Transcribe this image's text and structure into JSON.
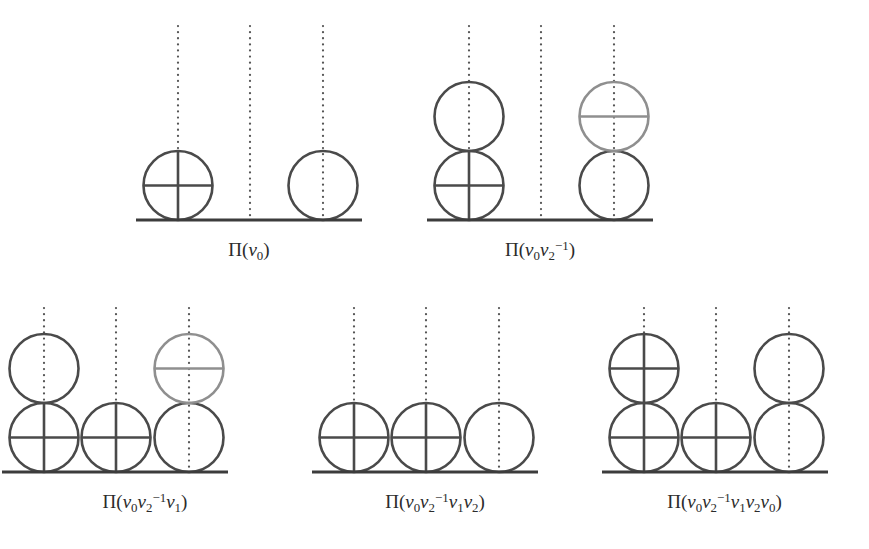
{
  "figure": {
    "background_color": "#ffffff",
    "stroke_color_dark": "#4a4a4a",
    "stroke_color_light": "#8f8f8f",
    "baseline_color": "#3c3c3c",
    "dot_color": "#555555",
    "label_color": "#2b2b2b",
    "circle_radius": 34.5,
    "column_spacing": 72,
    "stroke_width": 2.6,
    "baseline_width": 3.2
  },
  "panels": [
    {
      "id": "panel-1",
      "label_text": "Π(v₀)",
      "label_parts": {
        "pi": "Π",
        "open": "(",
        "terms": [
          {
            "base": "v",
            "sub": "0",
            "sup": ""
          }
        ],
        "close": ")"
      },
      "x": 104,
      "y": 8,
      "width": 290,
      "height": 250,
      "baseline": {
        "x1": 32,
        "x2": 258,
        "y": 212
      },
      "columns": [
        {
          "name": "column-1",
          "cx": 74,
          "dotted_top": 18,
          "circles": [
            {
              "level": 0,
              "marks": "cross",
              "tone": "dark"
            }
          ]
        },
        {
          "name": "column-2",
          "cx": 146,
          "dotted_top": 18,
          "circles": []
        },
        {
          "name": "column-3",
          "cx": 219,
          "dotted_top": 18,
          "circles": [
            {
              "level": 0,
              "marks": "none",
              "tone": "dark"
            }
          ]
        }
      ]
    },
    {
      "id": "panel-2",
      "label_text": "Π(v₀v₂⁻¹)",
      "label_parts": {
        "pi": "Π",
        "open": "(",
        "terms": [
          {
            "base": "v",
            "sub": "0",
            "sup": ""
          },
          {
            "base": "v",
            "sub": "2",
            "sup": "−1"
          }
        ],
        "close": ")"
      },
      "x": 395,
      "y": 8,
      "width": 290,
      "height": 250,
      "baseline": {
        "x1": 32,
        "x2": 258,
        "y": 212
      },
      "columns": [
        {
          "name": "column-1",
          "cx": 74,
          "dotted_top": 18,
          "circles": [
            {
              "level": 0,
              "marks": "cross",
              "tone": "dark"
            },
            {
              "level": 1,
              "marks": "none",
              "tone": "dark"
            }
          ]
        },
        {
          "name": "column-2",
          "cx": 146,
          "dotted_top": 18,
          "circles": []
        },
        {
          "name": "column-3",
          "cx": 219,
          "dotted_top": 18,
          "circles": [
            {
              "level": 0,
              "marks": "none",
              "tone": "dark"
            },
            {
              "level": 1,
              "marks": "horizontal",
              "tone": "light"
            }
          ]
        }
      ]
    },
    {
      "id": "panel-3",
      "label_text": "Π(v₀v₂⁻¹v₁)",
      "label_parts": {
        "pi": "Π",
        "open": "(",
        "terms": [
          {
            "base": "v",
            "sub": "0",
            "sup": ""
          },
          {
            "base": "v",
            "sub": "2",
            "sup": "−1"
          },
          {
            "base": "v",
            "sub": "1",
            "sup": ""
          }
        ],
        "close": ")"
      },
      "x": 0,
      "y": 290,
      "width": 290,
      "height": 250,
      "baseline": {
        "x1": 2,
        "x2": 228,
        "y": 182
      },
      "columns": [
        {
          "name": "column-1",
          "cx": 44,
          "dotted_top": 18,
          "circles": [
            {
              "level": 0,
              "marks": "cross",
              "tone": "dark"
            },
            {
              "level": 1,
              "marks": "none",
              "tone": "dark"
            }
          ]
        },
        {
          "name": "column-2",
          "cx": 116,
          "dotted_top": 18,
          "circles": [
            {
              "level": 0,
              "marks": "cross",
              "tone": "dark"
            }
          ]
        },
        {
          "name": "column-3",
          "cx": 189,
          "dotted_top": 18,
          "circles": [
            {
              "level": 0,
              "marks": "none",
              "tone": "dark"
            },
            {
              "level": 1,
              "marks": "horizontal",
              "tone": "light"
            }
          ]
        }
      ]
    },
    {
      "id": "panel-4",
      "label_text": "Π(v₀v₂⁻¹v₁v₂)",
      "label_parts": {
        "pi": "Π",
        "open": "(",
        "terms": [
          {
            "base": "v",
            "sub": "0",
            "sup": ""
          },
          {
            "base": "v",
            "sub": "2",
            "sup": "−1"
          },
          {
            "base": "v",
            "sub": "1",
            "sup": ""
          },
          {
            "base": "v",
            "sub": "2",
            "sup": ""
          }
        ],
        "close": ")"
      },
      "x": 290,
      "y": 290,
      "width": 290,
      "height": 250,
      "baseline": {
        "x1": 22,
        "x2": 248,
        "y": 182
      },
      "columns": [
        {
          "name": "column-1",
          "cx": 64,
          "dotted_top": 18,
          "circles": [
            {
              "level": 0,
              "marks": "cross",
              "tone": "dark"
            }
          ]
        },
        {
          "name": "column-2",
          "cx": 136,
          "dotted_top": 18,
          "circles": [
            {
              "level": 0,
              "marks": "cross",
              "tone": "dark"
            }
          ]
        },
        {
          "name": "column-3",
          "cx": 209,
          "dotted_top": 18,
          "circles": [
            {
              "level": 0,
              "marks": "none",
              "tone": "dark"
            }
          ]
        }
      ]
    },
    {
      "id": "panel-5",
      "label_text": "Π(v₀v₂⁻¹v₁v₂v₀)",
      "label_parts": {
        "pi": "Π",
        "open": "(",
        "terms": [
          {
            "base": "v",
            "sub": "0",
            "sup": ""
          },
          {
            "base": "v",
            "sub": "2",
            "sup": "−1"
          },
          {
            "base": "v",
            "sub": "1",
            "sup": ""
          },
          {
            "base": "v",
            "sub": "2",
            "sup": ""
          },
          {
            "base": "v",
            "sub": "0",
            "sup": ""
          }
        ],
        "close": ")"
      },
      "x": 580,
      "y": 290,
      "width": 289,
      "height": 250,
      "baseline": {
        "x1": 22,
        "x2": 248,
        "y": 182
      },
      "columns": [
        {
          "name": "column-1",
          "cx": 64,
          "dotted_top": 18,
          "circles": [
            {
              "level": 0,
              "marks": "cross",
              "tone": "dark"
            },
            {
              "level": 1,
              "marks": "cross",
              "tone": "dark"
            }
          ]
        },
        {
          "name": "column-2",
          "cx": 136,
          "dotted_top": 18,
          "circles": [
            {
              "level": 0,
              "marks": "cross",
              "tone": "dark"
            }
          ]
        },
        {
          "name": "column-3",
          "cx": 209,
          "dotted_top": 18,
          "circles": [
            {
              "level": 0,
              "marks": "none",
              "tone": "dark"
            },
            {
              "level": 1,
              "marks": "none",
              "tone": "dark"
            }
          ]
        }
      ]
    }
  ]
}
